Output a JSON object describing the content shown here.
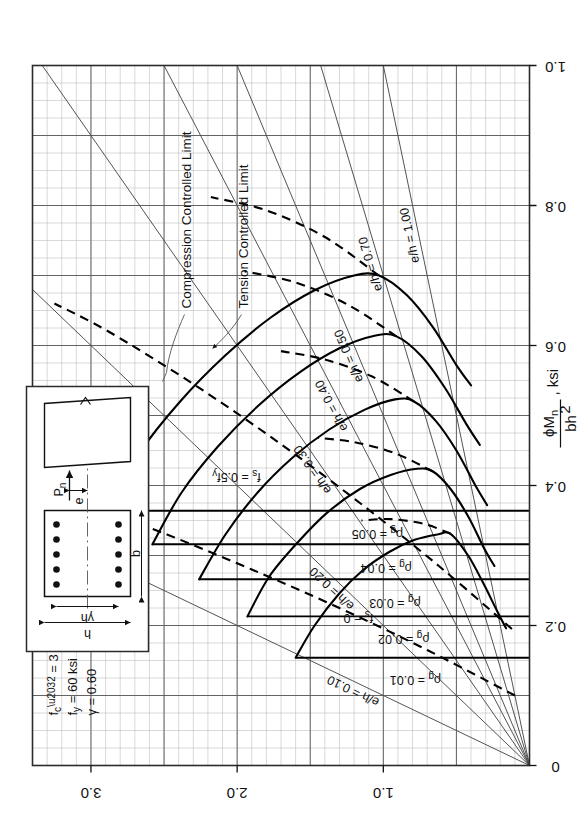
{
  "figure": {
    "type": "column-interaction-diagram",
    "parameters": [
      {
        "symbol": "f'c",
        "value": "= 3 ksi"
      },
      {
        "symbol": "fy",
        "value": "= 60 ksi"
      },
      {
        "symbol": "γ",
        "value": "= 0.60"
      }
    ],
    "param_lines": [
      "f′c  =  3 ksi",
      "fy  =  60 ksi",
      "γ  =  0.60"
    ],
    "section_sketch": {
      "h_label": "h",
      "gamma_h_label": "γh",
      "b_label": "b",
      "pn_label": "Pn",
      "e_label": "e",
      "bars_top": 5,
      "bars_bottom": 5
    }
  },
  "chart_data": {
    "type": "line",
    "title": "",
    "xlabel": "ϕMn / bh²,  ksi",
    "ylabel": "ϕPn / bh,  ksi",
    "xlabel_parts": {
      "num": "ϕM",
      "num_sub": "n",
      "unit": ", ksi",
      "den": "bh",
      "den_sup": "2"
    },
    "ylabel_parts": {
      "num": "ϕP",
      "num_sub": "n",
      "unit": ", ksi",
      "den": "bh"
    },
    "xlim": [
      0,
      1.0
    ],
    "ylim": [
      0,
      3.4
    ],
    "xticks": [
      0,
      0.2,
      0.4,
      0.6,
      0.8,
      1.0
    ],
    "xticklabels": [
      "0",
      "0.2",
      "0.4",
      "0.6",
      "0.8",
      "1.0"
    ],
    "yticks": [
      1.0,
      2.0,
      3.0
    ],
    "yticklabels": [
      "1.0",
      "2.0",
      "3.0"
    ],
    "grid": "major-and-minor",
    "grid_minor_step_x": 0.025,
    "grid_minor_step_y": 0.1,
    "grid_major_step_x": 0.1,
    "grid_major_step_y": 0.5,
    "legend": "inline-labels",
    "series": [
      {
        "name": "ρg = 0.01",
        "label": "ρg = 0.01",
        "rho": 0.01,
        "kind": "capacity-curve",
        "points": [
          [
            0.154,
            1.6
          ],
          [
            0.2,
            1.47
          ],
          [
            0.246,
            1.3
          ],
          [
            0.279,
            1.14
          ],
          [
            0.305,
            0.96
          ],
          [
            0.322,
            0.79
          ],
          [
            0.33,
            0.63
          ],
          [
            0.331,
            0.54
          ],
          [
            0.3,
            0.42
          ],
          [
            0.262,
            0.32
          ],
          [
            0.22,
            0.22
          ],
          [
            0.196,
            0.16
          ]
        ]
      },
      {
        "name": "ρg = 0.02",
        "label": "ρg = 0.02",
        "rho": 0.02,
        "kind": "capacity-curve",
        "points": [
          [
            0.213,
            1.93
          ],
          [
            0.27,
            1.78
          ],
          [
            0.32,
            1.58
          ],
          [
            0.362,
            1.38
          ],
          [
            0.395,
            1.16
          ],
          [
            0.415,
            0.95
          ],
          [
            0.424,
            0.77
          ],
          [
            0.42,
            0.66
          ],
          [
            0.395,
            0.54
          ],
          [
            0.356,
            0.42
          ],
          [
            0.31,
            0.31
          ],
          [
            0.285,
            0.24
          ]
        ]
      },
      {
        "name": "ρg = 0.03",
        "label": "ρg = 0.03",
        "rho": 0.03,
        "kind": "capacity-curve",
        "points": [
          [
            0.266,
            2.26
          ],
          [
            0.33,
            2.08
          ],
          [
            0.39,
            1.86
          ],
          [
            0.44,
            1.62
          ],
          [
            0.48,
            1.37
          ],
          [
            0.508,
            1.13
          ],
          [
            0.523,
            0.92
          ],
          [
            0.52,
            0.79
          ],
          [
            0.492,
            0.64
          ],
          [
            0.45,
            0.5
          ],
          [
            0.4,
            0.37
          ],
          [
            0.372,
            0.29
          ]
        ]
      },
      {
        "name": "ρg = 0.04",
        "label": "ρg = 0.04",
        "rho": 0.04,
        "kind": "capacity-curve",
        "points": [
          [
            0.316,
            2.58
          ],
          [
            0.39,
            2.38
          ],
          [
            0.456,
            2.13
          ],
          [
            0.515,
            1.85
          ],
          [
            0.562,
            1.57
          ],
          [
            0.596,
            1.3
          ],
          [
            0.614,
            1.06
          ],
          [
            0.613,
            0.91
          ],
          [
            0.585,
            0.74
          ],
          [
            0.54,
            0.58
          ],
          [
            0.487,
            0.43
          ],
          [
            0.458,
            0.34
          ]
        ]
      },
      {
        "name": "ρg = 0.05",
        "label": "ρg = 0.05",
        "rho": 0.05,
        "kind": "capacity-curve",
        "points": [
          [
            0.364,
            2.89
          ],
          [
            0.446,
            2.67
          ],
          [
            0.52,
            2.39
          ],
          [
            0.586,
            2.08
          ],
          [
            0.64,
            1.77
          ],
          [
            0.679,
            1.47
          ],
          [
            0.7,
            1.2
          ],
          [
            0.7,
            1.03
          ],
          [
            0.672,
            0.84
          ],
          [
            0.626,
            0.66
          ],
          [
            0.572,
            0.5
          ],
          [
            0.543,
            0.4
          ]
        ]
      }
    ],
    "radial_lines": [
      {
        "label": "e/h = 0.10",
        "value": 0.1
      },
      {
        "label": "e/h = 0.20",
        "value": 0.2
      },
      {
        "label": "e/h = 0.30",
        "value": 0.3
      },
      {
        "label": "e/h = 0.40",
        "value": 0.4
      },
      {
        "label": "e/h = 0.50",
        "value": 0.5
      },
      {
        "label": "e/h = 0.70",
        "value": 0.7
      },
      {
        "label": "e/h = 1.00",
        "value": 1.0
      }
    ],
    "dashed_lines": [
      {
        "label": "fs = 0",
        "name": "fs-zero-line"
      },
      {
        "label": "fs = 0.5fy",
        "name": "fs-half-fy-line"
      }
    ],
    "annotations": [
      {
        "label": "Compression Controlled Limit",
        "name": "compression-controlled-limit"
      },
      {
        "label": "Tension Controlled Limit",
        "name": "tension-controlled-limit"
      }
    ],
    "rho_labels": [
      "ρg = 0.01",
      "ρg = 0.02",
      "ρg = 0.03",
      "ρg = 0.04",
      "ρg = 0.05"
    ]
  }
}
